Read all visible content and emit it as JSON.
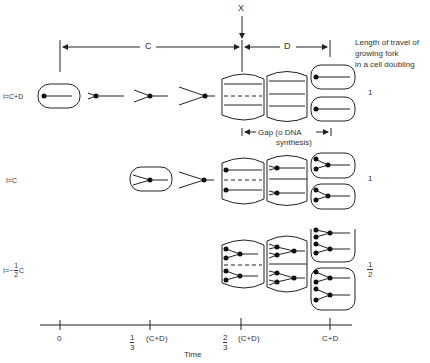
{
  "marker": {
    "label": "X"
  },
  "dimensions": {
    "c_label": "C",
    "d_label": "D"
  },
  "legend": {
    "line1": "Length of travel of",
    "line2": "growing fork",
    "line3": "in a cell doubling"
  },
  "gap": {
    "line1": "Gap (o DNA",
    "line2": "synthesis)"
  },
  "rows": [
    {
      "label": "I=C+D",
      "fork_travel": "1"
    },
    {
      "label": "I=C",
      "fork_travel": "1"
    },
    {
      "label_prefix": "I=~",
      "frac_num": "1",
      "frac_den": "2",
      "label_suffix": "C",
      "fork_travel_num": "1",
      "fork_travel_den": "2"
    }
  ],
  "time_axis": {
    "label": "Time",
    "ticks": [
      {
        "value": "0"
      },
      {
        "frac_num": "1",
        "frac_den": "3",
        "suffix": "(C+D)"
      },
      {
        "frac_num": "2",
        "frac_den": "3",
        "suffix": "(C+D)"
      },
      {
        "value": "C+D"
      }
    ]
  }
}
